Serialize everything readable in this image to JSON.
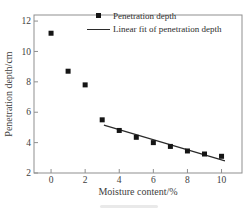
{
  "chart_data": {
    "type": "scatter",
    "title": "",
    "xlabel": "Moisture content/%",
    "ylabel": "Penetration depth/cm",
    "xlim": [
      -1,
      11.2
    ],
    "ylim": [
      2,
      12.4
    ],
    "xticks": [
      0,
      2,
      4,
      6,
      8,
      10
    ],
    "yticks": [
      2,
      4,
      6,
      8,
      10,
      12
    ],
    "grid": false,
    "legend_position": "top-right-inside",
    "series": [
      {
        "name": "Penetration depth",
        "kind": "scatter",
        "marker": "square",
        "color": "#151515",
        "x": [
          0,
          1,
          2,
          3,
          4,
          5,
          6,
          7,
          8,
          9,
          10
        ],
        "y": [
          11.2,
          8.7,
          7.8,
          5.5,
          4.8,
          4.35,
          4.0,
          3.75,
          3.45,
          3.25,
          3.1
        ]
      },
      {
        "name": "Linear fit of penetration depth",
        "kind": "line",
        "color": "#2b2b2b",
        "x": [
          3.1,
          10.2
        ],
        "y": [
          5.15,
          2.8
        ]
      }
    ],
    "colors": {
      "frame": "#8f8f8f",
      "text": "#3d3d3d",
      "marker": "#151515",
      "fit_line": "#2b2b2b"
    }
  }
}
